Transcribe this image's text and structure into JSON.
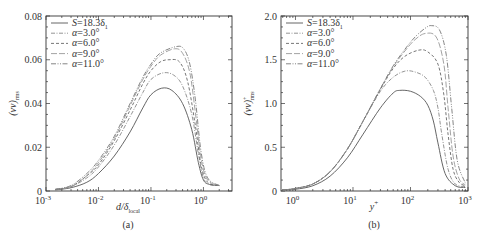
{
  "chart_data": [
    {
      "panel": "(a)",
      "type": "line",
      "xscale": "log",
      "xlabel": "d/δ_local",
      "xlabel_main": "d/δ",
      "xlabel_sub": "local",
      "ylabel": "(vv)_rms",
      "ylabel_main": "(vv)",
      "ylabel_sub": "rms",
      "xlim": [
        0.001,
        3.5
      ],
      "ylim": [
        0,
        0.08
      ],
      "xticks": [
        {
          "value": 0.001,
          "label": "10",
          "exp": "-3"
        },
        {
          "value": 0.01,
          "label": "10",
          "exp": "-2"
        },
        {
          "value": 0.1,
          "label": "10",
          "exp": "-1"
        },
        {
          "value": 1,
          "label": "10",
          "exp": "0"
        }
      ],
      "yticks": [
        {
          "value": 0,
          "label": "0"
        },
        {
          "value": 0.02,
          "label": "0.02"
        },
        {
          "value": 0.04,
          "label": "0.04"
        },
        {
          "value": 0.06,
          "label": "0.06"
        },
        {
          "value": 0.08,
          "label": "0.08"
        }
      ],
      "legend_position": "upper left",
      "grid": false,
      "series": [
        {
          "name": "S=18.3δ1",
          "style": "solid",
          "color": "#555555",
          "peak_x": 0.16,
          "peak_y": 0.047,
          "x": [
            0.0015,
            0.003,
            0.006,
            0.01,
            0.02,
            0.04,
            0.07,
            0.1,
            0.16,
            0.25,
            0.4,
            0.6,
            0.8,
            1.0,
            1.3,
            2.0
          ],
          "y": [
            0.0005,
            0.0015,
            0.004,
            0.008,
            0.016,
            0.027,
            0.038,
            0.044,
            0.047,
            0.046,
            0.04,
            0.028,
            0.013,
            0.005,
            0.003,
            0.0025
          ]
        },
        {
          "name": "α=3.0°",
          "style": "dashdot",
          "color": "#888888",
          "peak_x": 0.17,
          "peak_y": 0.054,
          "x": [
            0.0015,
            0.003,
            0.006,
            0.01,
            0.02,
            0.04,
            0.07,
            0.1,
            0.17,
            0.27,
            0.4,
            0.6,
            0.8,
            1.0,
            1.3,
            2.0
          ],
          "y": [
            0.0006,
            0.002,
            0.006,
            0.011,
            0.021,
            0.034,
            0.045,
            0.051,
            0.054,
            0.053,
            0.048,
            0.035,
            0.017,
            0.006,
            0.003,
            0.0025
          ]
        },
        {
          "name": "α=6.0°",
          "style": "dashed",
          "color": "#666666",
          "peak_x": 0.22,
          "peak_y": 0.06,
          "x": [
            0.0015,
            0.003,
            0.006,
            0.01,
            0.02,
            0.04,
            0.07,
            0.1,
            0.15,
            0.22,
            0.35,
            0.5,
            0.7,
            0.9,
            1.2,
            2.0
          ],
          "y": [
            0.0007,
            0.002,
            0.007,
            0.012,
            0.023,
            0.037,
            0.049,
            0.055,
            0.059,
            0.06,
            0.059,
            0.05,
            0.03,
            0.012,
            0.004,
            0.0025
          ]
        },
        {
          "name": "α=9.0°",
          "style": "longdash",
          "color": "#999999",
          "peak_x": 0.28,
          "peak_y": 0.065,
          "x": [
            0.0015,
            0.003,
            0.006,
            0.01,
            0.02,
            0.04,
            0.07,
            0.1,
            0.15,
            0.28,
            0.4,
            0.55,
            0.7,
            0.9,
            1.2,
            2.0
          ],
          "y": [
            0.0007,
            0.002,
            0.007,
            0.013,
            0.024,
            0.039,
            0.051,
            0.057,
            0.062,
            0.065,
            0.063,
            0.054,
            0.036,
            0.015,
            0.005,
            0.0025
          ]
        },
        {
          "name": "α=11.0°",
          "style": "dashdotdot",
          "color": "#777777",
          "peak_x": 0.3,
          "peak_y": 0.066,
          "x": [
            0.0015,
            0.003,
            0.006,
            0.01,
            0.02,
            0.04,
            0.07,
            0.1,
            0.15,
            0.3,
            0.42,
            0.55,
            0.7,
            0.9,
            1.2,
            2.0
          ],
          "y": [
            0.0008,
            0.0025,
            0.008,
            0.014,
            0.025,
            0.04,
            0.052,
            0.058,
            0.063,
            0.066,
            0.065,
            0.058,
            0.042,
            0.018,
            0.006,
            0.0025
          ]
        }
      ]
    },
    {
      "panel": "(b)",
      "type": "line",
      "xscale": "log",
      "xlabel": "y+",
      "xlabel_main": "y",
      "xlabel_sup": "+",
      "ylabel": "(vv)+_rms",
      "ylabel_main": "(vv)",
      "ylabel_sup": "+",
      "ylabel_sub": "rms",
      "xlim": [
        0.56,
        1000
      ],
      "ylim": [
        0,
        2.0
      ],
      "xticks": [
        {
          "value": 1,
          "label": "10",
          "exp": "0"
        },
        {
          "value": 10,
          "label": "10",
          "exp": "1"
        },
        {
          "value": 100,
          "label": "10",
          "exp": "2"
        },
        {
          "value": 1000,
          "label": "10",
          "exp": "3"
        }
      ],
      "yticks": [
        {
          "value": 0,
          "label": "0"
        },
        {
          "value": 0.5,
          "label": "0.5"
        },
        {
          "value": 1.0,
          "label": "1.0"
        },
        {
          "value": 1.5,
          "label": "1.5"
        },
        {
          "value": 2.0,
          "label": "2.0"
        }
      ],
      "legend_position": "upper left",
      "grid": false,
      "series": [
        {
          "name": "S=18.3δ1",
          "style": "solid",
          "color": "#555555",
          "peak_x": 65,
          "peak_y": 1.15,
          "x": [
            0.6,
            1,
            2,
            4,
            8,
            15,
            30,
            50,
            65,
            100,
            150,
            200,
            250,
            300,
            400,
            600,
            900
          ],
          "y": [
            0.01,
            0.02,
            0.06,
            0.17,
            0.38,
            0.65,
            0.95,
            1.12,
            1.15,
            1.14,
            1.08,
            0.98,
            0.8,
            0.55,
            0.2,
            0.06,
            0.04
          ]
        },
        {
          "name": "α=3.0°",
          "style": "dashdot",
          "color": "#888888",
          "peak_x": 80,
          "peak_y": 1.37,
          "x": [
            0.6,
            1,
            2,
            4,
            8,
            15,
            30,
            50,
            80,
            120,
            180,
            250,
            300,
            350,
            450,
            600,
            900
          ],
          "y": [
            0.01,
            0.03,
            0.08,
            0.22,
            0.48,
            0.8,
            1.14,
            1.3,
            1.37,
            1.36,
            1.3,
            1.15,
            0.95,
            0.65,
            0.25,
            0.08,
            0.05
          ]
        },
        {
          "name": "α=6.0°",
          "style": "dashed",
          "color": "#666666",
          "peak_x": 140,
          "peak_y": 1.61,
          "x": [
            0.6,
            1,
            2,
            4,
            8,
            15,
            30,
            50,
            80,
            140,
            200,
            300,
            380,
            450,
            550,
            700,
            900
          ],
          "y": [
            0.01,
            0.03,
            0.08,
            0.22,
            0.48,
            0.8,
            1.16,
            1.4,
            1.54,
            1.61,
            1.59,
            1.45,
            1.1,
            0.65,
            0.25,
            0.1,
            0.06
          ]
        },
        {
          "name": "α=9.0°",
          "style": "longdash",
          "color": "#999999",
          "peak_x": 180,
          "peak_y": 1.8,
          "x": [
            0.6,
            1,
            2,
            4,
            8,
            15,
            30,
            50,
            80,
            120,
            180,
            280,
            380,
            450,
            550,
            700,
            900
          ],
          "y": [
            0.01,
            0.03,
            0.08,
            0.22,
            0.48,
            0.8,
            1.17,
            1.42,
            1.6,
            1.73,
            1.8,
            1.76,
            1.45,
            0.95,
            0.4,
            0.14,
            0.07
          ]
        },
        {
          "name": "α=11.0°",
          "style": "dashdotdot",
          "color": "#777777",
          "peak_x": 230,
          "peak_y": 1.89,
          "x": [
            0.6,
            1,
            2,
            4,
            8,
            15,
            30,
            50,
            80,
            120,
            180,
            230,
            320,
            420,
            520,
            650,
            900
          ],
          "y": [
            0.01,
            0.03,
            0.08,
            0.22,
            0.48,
            0.8,
            1.17,
            1.43,
            1.62,
            1.76,
            1.86,
            1.89,
            1.84,
            1.55,
            0.95,
            0.35,
            0.09
          ]
        }
      ]
    }
  ],
  "panels": {
    "a": {
      "label": "(a)"
    },
    "b": {
      "label": "(b)"
    }
  },
  "legend": {
    "entries": [
      {
        "prefix": "S",
        "text": "=18.3δ",
        "sub": "1"
      },
      {
        "prefix": "α",
        "text": "=3.0°",
        "sub": ""
      },
      {
        "prefix": "α",
        "text": "=6.0°",
        "sub": ""
      },
      {
        "prefix": "α",
        "text": "=9.0°",
        "sub": ""
      },
      {
        "prefix": "α",
        "text": "=11.0°",
        "sub": ""
      }
    ]
  }
}
